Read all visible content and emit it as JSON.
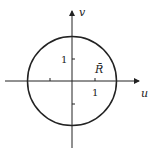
{
  "diagram": {
    "axes": {
      "x_label": "u",
      "y_label": "v"
    },
    "ticks": {
      "x_one": "1",
      "y_one": "1"
    },
    "region_label": "R̄",
    "circle": {
      "center": [
        0,
        0
      ],
      "radius": 2
    },
    "colors": {
      "stroke": "#222222"
    }
  }
}
